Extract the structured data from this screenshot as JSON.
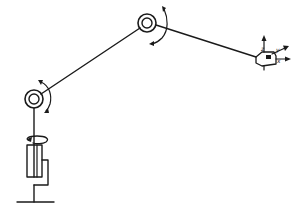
{
  "diagram": {
    "colors": {
      "line": "#1a1a1a",
      "background": "#ffffff"
    },
    "components": [
      {
        "name": "base",
        "type": "ground"
      },
      {
        "name": "waist-joint",
        "type": "rotary-cylinder",
        "motion": "rotation-about-vertical-axis"
      },
      {
        "name": "shoulder-joint",
        "type": "revolute",
        "motion": "rotation"
      },
      {
        "name": "upper-arm",
        "type": "link"
      },
      {
        "name": "elbow-joint",
        "type": "revolute",
        "motion": "rotation"
      },
      {
        "name": "forearm",
        "type": "link"
      },
      {
        "name": "end-effector",
        "type": "wrist",
        "axes": [
          "z",
          "y",
          "x"
        ]
      }
    ],
    "labels": {
      "axis_z": "z",
      "axis_y": "y",
      "axis_x": "x"
    }
  }
}
